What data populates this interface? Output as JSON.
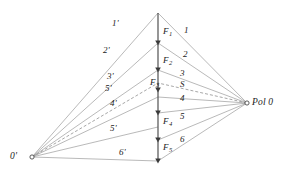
{
  "diagram": {
    "type": "funicular-force-polygon",
    "background_color": "#ffffff",
    "stroke_color": "#8a8a8a",
    "load_line_color": "#4a4a4a",
    "text_color": "#1a1a1a",
    "poles": [
      {
        "id": "left-pole",
        "label": "0'",
        "x": 32,
        "y": 157,
        "label_x": 10,
        "label_y": 152
      },
      {
        "id": "right-pole",
        "label": "Pol 0",
        "x": 247,
        "y": 103,
        "label_x": 252,
        "label_y": 98
      }
    ],
    "load_line": {
      "x": 158,
      "y_top": 13,
      "y_bottom": 161,
      "nodes": [
        13,
        43,
        70,
        90,
        113,
        140,
        161
      ]
    },
    "forces": [
      {
        "label": "F",
        "index": "1",
        "label_x": 163,
        "label_y": 27
      },
      {
        "label": "F",
        "index": "2",
        "label_x": 163,
        "label_y": 56
      },
      {
        "label": "F",
        "index": "3",
        "label_x": 150,
        "label_y": 78
      },
      {
        "label": "F",
        "index": "4",
        "label_x": 163,
        "label_y": 117
      },
      {
        "label": "F",
        "index": "5",
        "label_x": 163,
        "label_y": 143
      }
    ],
    "left_rays": [
      {
        "label": "1'",
        "node_y": 13,
        "label_x": 112,
        "label_y": 19,
        "dashed": false
      },
      {
        "label": "2'",
        "node_y": 43,
        "label_x": 103,
        "label_y": 46,
        "dashed": false
      },
      {
        "label": "3'",
        "node_y": 70,
        "label_x": 107,
        "label_y": 72,
        "dashed": false
      },
      {
        "label": "5'",
        "node_y": 83,
        "label_x": 105,
        "label_y": 84,
        "dashed": true
      },
      {
        "label": "4'",
        "node_y": 97,
        "label_x": 110,
        "label_y": 99,
        "dashed": false
      },
      {
        "label": "5'",
        "node_y": 127,
        "label_x": 110,
        "label_y": 124,
        "dashed": false
      },
      {
        "label": "6'",
        "node_y": 161,
        "label_x": 119,
        "label_y": 148,
        "dashed": false
      }
    ],
    "right_rays": [
      {
        "label": "1",
        "node_y": 13,
        "label_x": 184,
        "label_y": 26,
        "dashed": false
      },
      {
        "label": "2",
        "node_y": 43,
        "label_x": 183,
        "label_y": 50,
        "dashed": false
      },
      {
        "label": "3",
        "node_y": 70,
        "label_x": 180,
        "label_y": 69,
        "dashed": false
      },
      {
        "label": "S",
        "node_y": 83,
        "label_x": 180,
        "label_y": 80,
        "dashed": true
      },
      {
        "label": "4",
        "node_y": 97,
        "label_x": 180,
        "label_y": 94,
        "dashed": false
      },
      {
        "label": "5",
        "node_y": 113,
        "label_x": 180,
        "label_y": 112,
        "dashed": false
      },
      {
        "label": "6",
        "node_y": 140,
        "label_x": 180,
        "label_y": 135,
        "dashed": false
      },
      {
        "label": "",
        "node_y": 161,
        "label_x": 0,
        "label_y": 0,
        "dashed": false
      }
    ]
  }
}
